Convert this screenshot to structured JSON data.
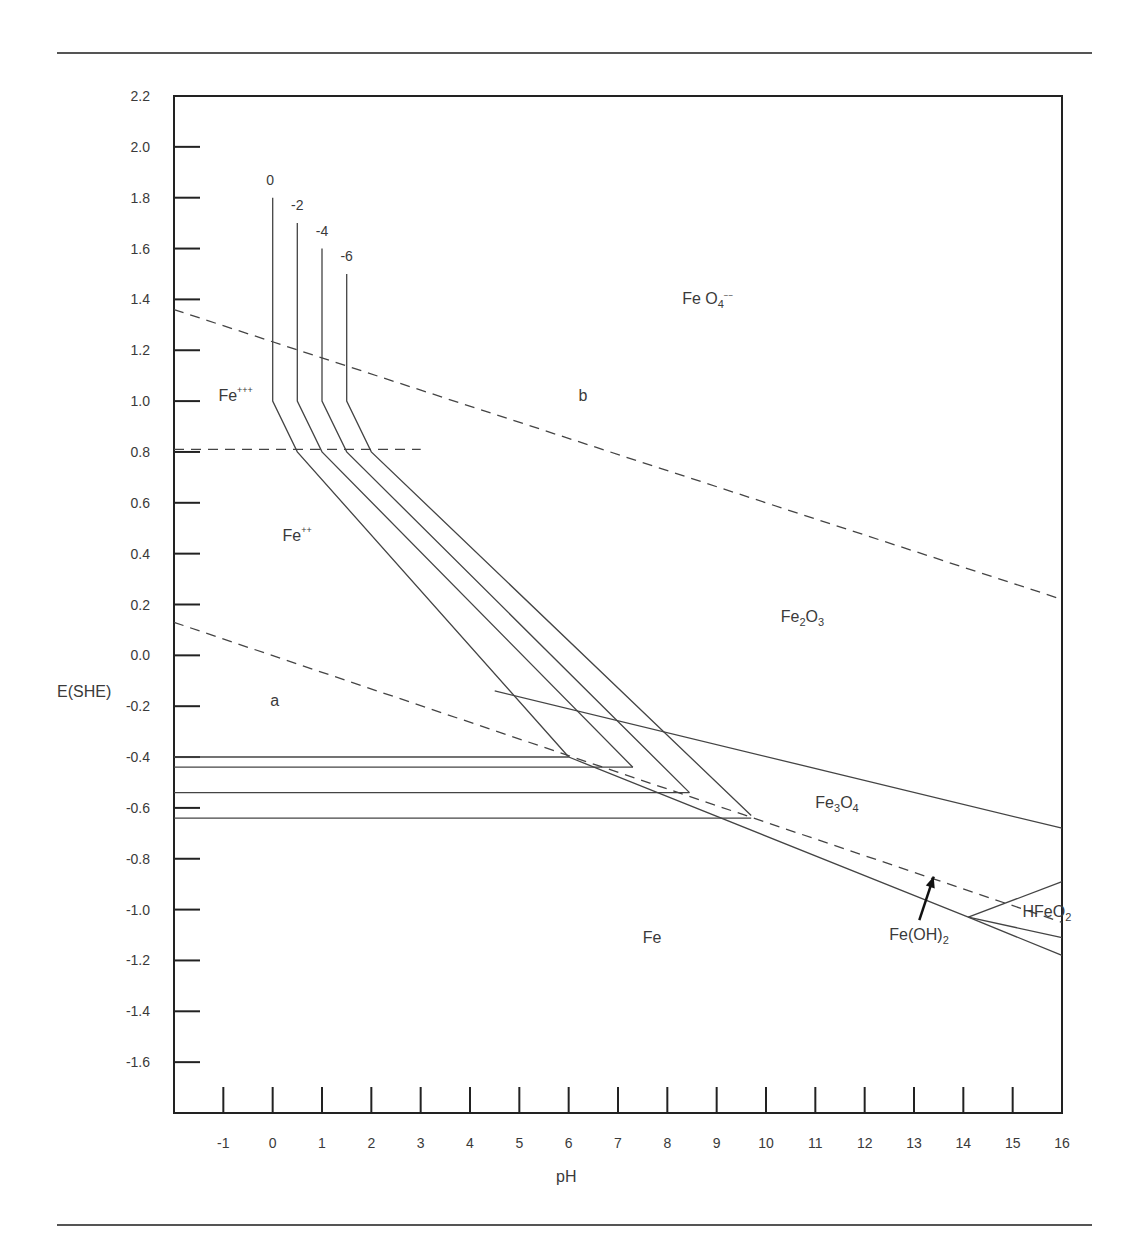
{
  "page": {
    "top_rule": true,
    "bottom_rule": true
  },
  "chart_data": {
    "type": "line",
    "title": "",
    "subtitle": "Potential-pH (Pourbaix) diagram for the iron-water system",
    "xlabel": "pH",
    "ylabel": "E(SHE)",
    "xlim": [
      -2,
      16
    ],
    "ylim": [
      -1.8,
      2.2
    ],
    "grid": false,
    "x_ticks": [
      -1,
      0,
      1,
      2,
      3,
      4,
      5,
      6,
      7,
      8,
      9,
      10,
      11,
      12,
      13,
      14,
      15,
      16
    ],
    "y_ticks": [
      2.2,
      2.0,
      1.8,
      1.6,
      1.4,
      1.2,
      1.0,
      0.8,
      0.6,
      0.4,
      0.2,
      0.0,
      -0.2,
      -0.4,
      -0.6,
      -0.8,
      -1.0,
      -1.2,
      -1.4,
      -1.6
    ],
    "y_tick_labels": [
      "2.2",
      "2.0",
      "1.8",
      "1.6",
      "1.4",
      "1.2",
      "1.0",
      "0.8",
      "0.6",
      "0.4",
      "0.2",
      "0.0",
      "-0.2",
      "-0.4",
      "-0.6",
      "-0.8",
      "-1.0",
      "-1.2",
      "-1.4",
      "-1.6"
    ],
    "concentration_labels": [
      {
        "text": "0",
        "pH": -0.05,
        "E": 1.85
      },
      {
        "text": "-2",
        "pH": 0.5,
        "E": 1.75
      },
      {
        "text": "-4",
        "pH": 1.0,
        "E": 1.65
      },
      {
        "text": "-6",
        "pH": 1.5,
        "E": 1.55
      }
    ],
    "series": [
      {
        "name": "water line b (O2/H2O)",
        "style": "dashed",
        "points": [
          [
            -2,
            1.36
          ],
          [
            16,
            0.22
          ]
        ]
      },
      {
        "name": "water line a (H2/H+)",
        "style": "dashed",
        "points": [
          [
            -2,
            0.13
          ],
          [
            16,
            -1.05
          ]
        ]
      },
      {
        "name": "Fe+++/Fe++ boundary",
        "style": "dashed",
        "points": [
          [
            -2,
            0.81
          ],
          [
            3,
            0.81
          ]
        ]
      },
      {
        "name": "conc 0 boundary",
        "style": "solid",
        "points": [
          [
            0,
            1.8
          ],
          [
            0,
            1.0
          ],
          [
            0.5,
            0.8
          ],
          [
            6.0,
            -0.4
          ]
        ]
      },
      {
        "name": "conc -2 boundary",
        "style": "solid",
        "points": [
          [
            0.5,
            1.7
          ],
          [
            0.5,
            1.0
          ],
          [
            1.0,
            0.8
          ],
          [
            7.3,
            -0.44
          ]
        ]
      },
      {
        "name": "conc -4 boundary",
        "style": "solid",
        "points": [
          [
            1.0,
            1.6
          ],
          [
            1.0,
            1.0
          ],
          [
            1.5,
            0.8
          ],
          [
            8.45,
            -0.54
          ]
        ]
      },
      {
        "name": "conc -6 boundary",
        "style": "solid",
        "points": [
          [
            1.5,
            1.5
          ],
          [
            1.5,
            1.0
          ],
          [
            2.0,
            0.8
          ],
          [
            9.7,
            -0.63
          ]
        ]
      },
      {
        "name": "Fe++/Fe conc 0",
        "style": "solid",
        "points": [
          [
            -2,
            -0.4
          ],
          [
            6.0,
            -0.4
          ]
        ]
      },
      {
        "name": "Fe++/Fe conc -2",
        "style": "solid",
        "points": [
          [
            -2,
            -0.44
          ],
          [
            7.3,
            -0.44
          ]
        ]
      },
      {
        "name": "Fe++/Fe conc -4",
        "style": "solid",
        "points": [
          [
            -2,
            -0.54
          ],
          [
            8.45,
            -0.54
          ]
        ]
      },
      {
        "name": "Fe++/Fe conc -6",
        "style": "solid",
        "points": [
          [
            -2,
            -0.64
          ],
          [
            9.7,
            -0.64
          ]
        ]
      },
      {
        "name": "Fe2O3/Fe3O4 boundary",
        "style": "solid",
        "points": [
          [
            4.5,
            -0.14
          ],
          [
            16,
            -0.68
          ]
        ]
      },
      {
        "name": "Fe3O4/Fe boundary",
        "style": "solid",
        "points": [
          [
            6.0,
            -0.4
          ],
          [
            14.1,
            -1.03
          ],
          [
            16,
            -1.18
          ]
        ]
      },
      {
        "name": "HFeO2- upper boundary",
        "style": "solid",
        "points": [
          [
            14.1,
            -1.03
          ],
          [
            16,
            -0.89
          ]
        ]
      },
      {
        "name": "HFeO2- lower boundary",
        "style": "solid",
        "points": [
          [
            14.1,
            -1.03
          ],
          [
            16,
            -1.11
          ]
        ]
      }
    ],
    "annotations": [
      {
        "text": "Fe O4--",
        "label": "FeO4 2-",
        "pH": 8.3,
        "E": 1.38
      },
      {
        "text": "Fe+++",
        "label": "Fe3+",
        "pH": -1.1,
        "E": 1.0
      },
      {
        "text": "b",
        "pH": 6.2,
        "E": 1.0
      },
      {
        "text": "Fe++",
        "label": "Fe2+",
        "pH": 0.2,
        "E": 0.45
      },
      {
        "text": "Fe2O3",
        "pH": 10.3,
        "E": 0.13
      },
      {
        "text": "a",
        "pH": -0.05,
        "E": -0.2
      },
      {
        "text": "Fe3O4",
        "pH": 11.0,
        "E": -0.6
      },
      {
        "text": "Fe",
        "pH": 7.5,
        "E": -1.13
      },
      {
        "text": "Fe(OH)2",
        "pH": 12.5,
        "E": -1.12,
        "arrow_to": [
          13.4,
          -0.87
        ]
      },
      {
        "text": "HFeO2-",
        "label": "HFeO2",
        "pH": 15.2,
        "E": -1.03
      }
    ]
  }
}
